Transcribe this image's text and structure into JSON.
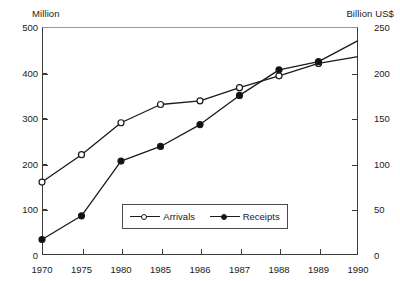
{
  "chart_data": {
    "type": "line",
    "title": "",
    "xlabel": "",
    "ylabel": "Million",
    "y2label": "Billion US$",
    "categories": [
      "1970",
      "1975",
      "1980",
      "1985",
      "1986",
      "1987",
      "1988",
      "1989",
      "1990"
    ],
    "grid": false,
    "legend_position": "inside-bottom-center",
    "ylim": [
      0,
      500
    ],
    "y2lim": [
      0,
      250
    ],
    "yticks": [
      0,
      100,
      200,
      300,
      400,
      500
    ],
    "y2ticks": [
      0,
      50,
      100,
      150,
      200,
      250
    ],
    "series": [
      {
        "name": "Arrivals",
        "axis": "left",
        "unit": "Million",
        "marker": "open-circle",
        "values": [
          160,
          220,
          290,
          330,
          338,
          367,
          393,
          420,
          435
        ]
      },
      {
        "name": "Receipts",
        "axis": "right",
        "unit": "Billion US$",
        "marker": "filled-circle",
        "values": [
          17,
          43,
          103,
          119,
          143,
          175,
          203,
          212,
          235
        ]
      }
    ]
  },
  "axes": {
    "left_unit_label": "Million",
    "right_unit_label": "Billion US$"
  },
  "legend": {
    "items": [
      {
        "label": "Arrivals",
        "marker": "open-circle"
      },
      {
        "label": "Receipts",
        "marker": "filled-circle"
      }
    ]
  },
  "colors": {
    "line": "#1a1a1a",
    "frame": "#3a3a3a",
    "frame_top": "#9a9a9a",
    "background": "#ffffff"
  }
}
